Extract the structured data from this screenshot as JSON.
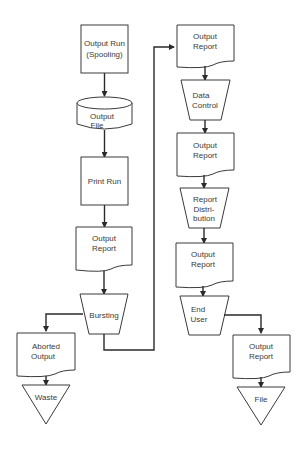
{
  "diagram": {
    "type": "flowchart",
    "nodes": {
      "output_run": {
        "shape": "process",
        "lines": [
          "Output Run",
          "(Spooling)"
        ]
      },
      "output_file": {
        "shape": "disk-storage",
        "lines": [
          "Output",
          "File"
        ]
      },
      "print_run": {
        "shape": "process",
        "lines": [
          "Print Run"
        ]
      },
      "output_report_1": {
        "shape": "document",
        "lines": [
          "Output",
          "Report"
        ]
      },
      "bursting": {
        "shape": "manual-operation",
        "lines": [
          "Bursting"
        ]
      },
      "aborted_output": {
        "shape": "document",
        "lines": [
          "Aborted",
          "Output"
        ]
      },
      "waste": {
        "shape": "offline-storage",
        "lines": [
          "Waste"
        ]
      },
      "output_report_2": {
        "shape": "document",
        "lines": [
          "Output",
          "Report"
        ]
      },
      "data_control": {
        "shape": "manual-operation",
        "lines": [
          "Data",
          "Control"
        ]
      },
      "output_report_3": {
        "shape": "document",
        "lines": [
          "Output",
          "Report"
        ]
      },
      "report_distribution": {
        "shape": "manual-operation",
        "lines": [
          "Report",
          "Distri-",
          "bution"
        ]
      },
      "output_report_4": {
        "shape": "document",
        "lines": [
          "Output",
          "Report"
        ]
      },
      "end_user": {
        "shape": "manual-operation",
        "lines": [
          "End",
          "User"
        ]
      },
      "output_report_5": {
        "shape": "document",
        "lines": [
          "Output",
          "Report"
        ]
      },
      "file": {
        "shape": "offline-storage",
        "lines": [
          "File"
        ]
      }
    },
    "edges": [
      [
        "output_run",
        "output_file"
      ],
      [
        "output_file",
        "print_run"
      ],
      [
        "print_run",
        "output_report_1"
      ],
      [
        "output_report_1",
        "bursting"
      ],
      [
        "bursting",
        "aborted_output"
      ],
      [
        "aborted_output",
        "waste"
      ],
      [
        "bursting",
        "output_report_2"
      ],
      [
        "output_report_2",
        "data_control"
      ],
      [
        "data_control",
        "output_report_3"
      ],
      [
        "output_report_3",
        "report_distribution"
      ],
      [
        "report_distribution",
        "output_report_4"
      ],
      [
        "output_report_4",
        "end_user"
      ],
      [
        "end_user",
        "output_report_5"
      ],
      [
        "output_report_5",
        "file"
      ]
    ],
    "colors": {
      "stroke": "#3a3a3a",
      "text": "#3a3a3a",
      "background": "#ffffff"
    }
  }
}
